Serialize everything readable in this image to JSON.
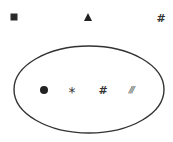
{
  "diagram": {
    "type": "set-diagram",
    "outside_symbols": [
      {
        "name": "square",
        "glyph": "",
        "x": 14,
        "y": 17
      },
      {
        "name": "triangle",
        "glyph": "",
        "x": 88,
        "y": 17
      },
      {
        "name": "hash",
        "glyph": "#",
        "x": 161,
        "y": 18
      }
    ],
    "ellipse": {
      "cx": 89,
      "cy": 89.5,
      "rx": 75,
      "ry": 43.5,
      "stroke": "#333333"
    },
    "inside_symbols": [
      {
        "name": "dot",
        "glyph": "",
        "x": 44,
        "y": 90
      },
      {
        "name": "asterisk",
        "glyph": "*",
        "x": 72,
        "y": 90
      },
      {
        "name": "hash",
        "glyph": "#",
        "x": 103,
        "y": 90
      },
      {
        "name": "triple-slash",
        "glyph": "///",
        "x": 131,
        "y": 90
      }
    ]
  }
}
